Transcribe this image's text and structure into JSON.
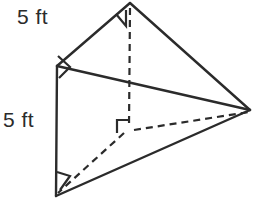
{
  "figure": {
    "stroke_color": "#2b2b2b",
    "background_color": "#ffffff",
    "labels": {
      "top_left_edge": "5 ft",
      "left_vertical_edge": "5 ft"
    },
    "vertices": {
      "top_apex": {
        "x": 130,
        "y": 3
      },
      "left_upper": {
        "x": 57,
        "y": 66
      },
      "left_lower": {
        "x": 56,
        "y": 196
      },
      "right_apex": {
        "x": 250,
        "y": 110
      },
      "hidden_interior": {
        "x": 128,
        "y": 128
      }
    },
    "edges": [
      {
        "name": "top-left-edge",
        "style": "solid",
        "from": "top_apex",
        "to": "left_upper"
      },
      {
        "name": "top-right-edge",
        "style": "solid",
        "from": "top_apex",
        "to": "right_apex"
      },
      {
        "name": "upper-middle-edge",
        "style": "solid",
        "from": "left_upper",
        "to": "right_apex"
      },
      {
        "name": "left-vertical-edge",
        "style": "solid",
        "from": "left_upper",
        "to": "left_lower"
      },
      {
        "name": "bottom-edge",
        "style": "solid",
        "from": "left_lower",
        "to": "right_apex"
      },
      {
        "name": "vertical-altitude",
        "style": "dashed",
        "from": "top_apex",
        "to": "hidden_interior"
      },
      {
        "name": "hidden-edge-to-left",
        "style": "dashed",
        "from": "hidden_interior",
        "to": "left_lower"
      },
      {
        "name": "hidden-edge-to-right",
        "style": "dashed",
        "from": "hidden_interior",
        "to": "right_apex"
      }
    ],
    "right_angle_markers": [
      {
        "name": "apex-right-angle",
        "at": "top_apex"
      },
      {
        "name": "left-upper-right-angle",
        "at": "left_upper"
      },
      {
        "name": "interior-right-angle",
        "at": "hidden_interior"
      },
      {
        "name": "left-lower-right-angle",
        "at": "left_lower"
      }
    ]
  }
}
